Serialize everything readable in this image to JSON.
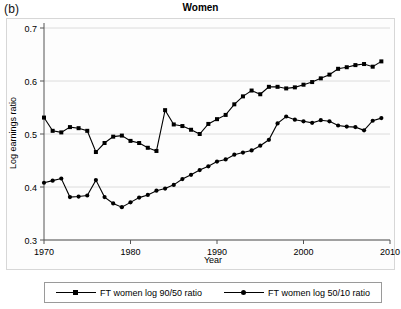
{
  "figure": {
    "panel_label": "(b)",
    "title": "Women"
  },
  "legend": {
    "position": "below-plot",
    "items": [
      {
        "label": "FT women log 90/50 ratio",
        "marker": "square-marker-icon",
        "color": "#000000"
      },
      {
        "label": "FT women log 50/10 ratio",
        "marker": "circle-marker-icon",
        "color": "#000000"
      }
    ]
  },
  "chart_data": {
    "type": "line",
    "title": "Women",
    "xlabel": "Year",
    "ylabel": "Log earnings ratio",
    "xlim": [
      1970,
      2010
    ],
    "ylim": [
      0.3,
      0.7
    ],
    "xticks": [
      1970,
      1980,
      1990,
      2000,
      2010
    ],
    "yticks": [
      0.3,
      0.4,
      0.5,
      0.6,
      0.7
    ],
    "ytick_labels": [
      "0.3",
      "0.4",
      "0.5",
      "0.6",
      "0.7"
    ],
    "xtick_labels": [
      "1970",
      "1980",
      "1990",
      "2000",
      "2010"
    ],
    "grid": "horizontal",
    "legend_position": "below",
    "x": [
      1970,
      1971,
      1972,
      1973,
      1974,
      1975,
      1976,
      1977,
      1978,
      1979,
      1980,
      1981,
      1982,
      1983,
      1984,
      1985,
      1986,
      1987,
      1988,
      1989,
      1990,
      1991,
      1992,
      1993,
      1994,
      1995,
      1996,
      1997,
      1998,
      1999,
      2000,
      2001,
      2002,
      2003,
      2004,
      2005,
      2006,
      2007,
      2008,
      2009
    ],
    "series": [
      {
        "name": "FT women log 90/50 ratio",
        "marker": "square",
        "color": "#000000",
        "values": [
          0.531,
          0.506,
          0.503,
          0.513,
          0.511,
          0.506,
          0.466,
          0.483,
          0.495,
          0.497,
          0.487,
          0.483,
          0.474,
          0.468,
          0.545,
          0.518,
          0.515,
          0.508,
          0.5,
          0.519,
          0.528,
          0.536,
          0.556,
          0.571,
          0.582,
          0.575,
          0.589,
          0.589,
          0.586,
          0.588,
          0.593,
          0.598,
          0.605,
          0.612,
          0.623,
          0.626,
          0.63,
          0.632,
          0.627,
          0.637
        ]
      },
      {
        "name": "FT women log 50/10 ratio",
        "marker": "circle",
        "color": "#000000",
        "values": [
          0.408,
          0.412,
          0.416,
          0.381,
          0.382,
          0.384,
          0.413,
          0.381,
          0.369,
          0.362,
          0.371,
          0.38,
          0.385,
          0.393,
          0.397,
          0.404,
          0.415,
          0.423,
          0.432,
          0.439,
          0.448,
          0.452,
          0.461,
          0.465,
          0.469,
          0.478,
          0.489,
          0.52,
          0.533,
          0.527,
          0.524,
          0.521,
          0.526,
          0.524,
          0.516,
          0.514,
          0.513,
          0.507,
          0.525,
          0.53
        ]
      }
    ]
  }
}
